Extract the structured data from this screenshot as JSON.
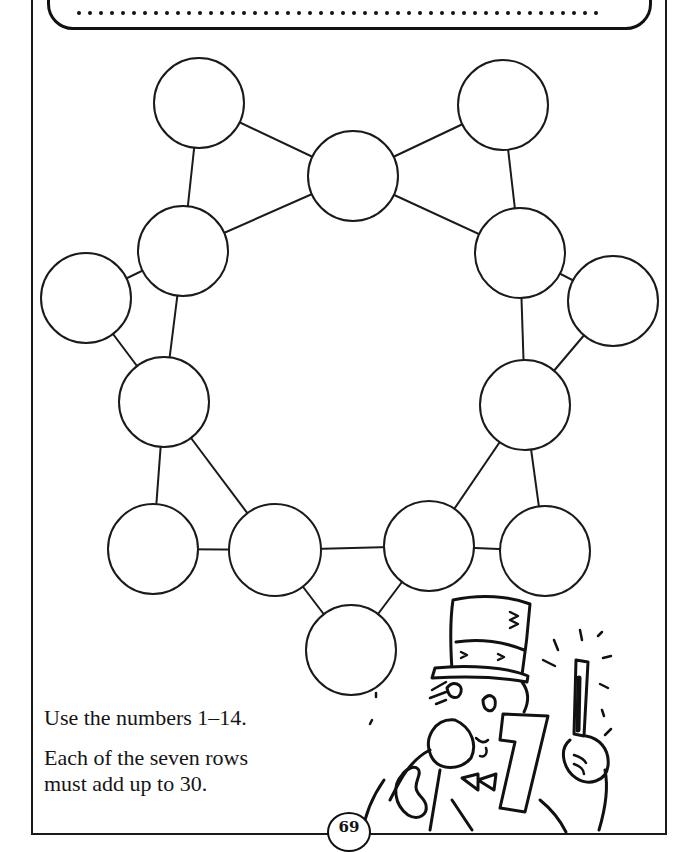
{
  "header": {
    "answer_line": "••••••••••••••••••••••••••••••••••••••••••••••••••••"
  },
  "puzzle": {
    "type": "magic-star-number-puzzle",
    "circle_count": 14,
    "circles": [
      {
        "id": "c1",
        "cx": 199,
        "cy": 103,
        "value": ""
      },
      {
        "id": "c2",
        "cx": 353,
        "cy": 176,
        "value": ""
      },
      {
        "id": "c3",
        "cx": 503,
        "cy": 105,
        "value": ""
      },
      {
        "id": "c4",
        "cx": 183,
        "cy": 251,
        "value": ""
      },
      {
        "id": "c5",
        "cx": 520,
        "cy": 253,
        "value": ""
      },
      {
        "id": "c6",
        "cx": 86,
        "cy": 298,
        "value": ""
      },
      {
        "id": "c7",
        "cx": 613,
        "cy": 301,
        "value": ""
      },
      {
        "id": "c8",
        "cx": 164,
        "cy": 402,
        "value": ""
      },
      {
        "id": "c9",
        "cx": 525,
        "cy": 405,
        "value": ""
      },
      {
        "id": "c10",
        "cx": 153,
        "cy": 549,
        "value": ""
      },
      {
        "id": "c11",
        "cx": 275,
        "cy": 550,
        "value": ""
      },
      {
        "id": "c12",
        "cx": 429,
        "cy": 546,
        "value": ""
      },
      {
        "id": "c13",
        "cx": 545,
        "cy": 551,
        "value": ""
      },
      {
        "id": "c14",
        "cx": 351,
        "cy": 650,
        "value": ""
      }
    ]
  },
  "instructions": {
    "line1": "Use the numbers 1–14.",
    "line2a": "Each of the seven rows",
    "line2b": "must add up to 30."
  },
  "page": {
    "number": "69"
  }
}
